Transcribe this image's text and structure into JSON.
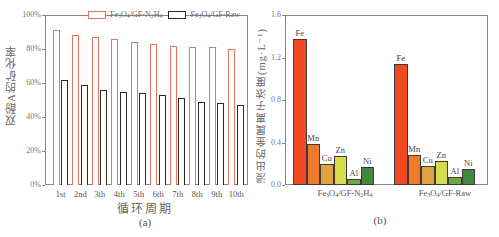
{
  "chart_data": [
    {
      "type": "bar",
      "panel_label": "(a)",
      "title": "",
      "xlabel": "循环周期",
      "ylabel": "双酚A的矿化率",
      "ylim": [
        0,
        100
      ],
      "yticks": [
        "0%",
        "20%",
        "40%",
        "60%",
        "80%",
        "100%"
      ],
      "categories": [
        "1st",
        "2nd",
        "3th",
        "4th",
        "5th",
        "6th",
        "7th",
        "8th",
        "9th",
        "10th"
      ],
      "series": [
        {
          "name": "Fe3O4/GF-N2H4",
          "color": "#e8765a",
          "style": "hollow",
          "values": [
            91,
            88,
            87,
            86,
            84,
            83,
            82,
            81,
            81,
            80
          ]
        },
        {
          "name": "Fe3O4/GF-Raw",
          "color": "#2a2a2a",
          "style": "hollow",
          "values": [
            62,
            59,
            56,
            55,
            54,
            53,
            51,
            49,
            48,
            47
          ]
        }
      ],
      "legend_position": "top-right",
      "grid": false
    },
    {
      "type": "bar",
      "panel_label": "(b)",
      "title": "",
      "xlabel": "",
      "ylabel": "浸出的金属离子浓度(mg·L⁻¹)",
      "ylim": [
        0,
        1.6
      ],
      "yticks": [
        "0.0",
        "0.4",
        "0.8",
        "1.2",
        "1.6"
      ],
      "categories": [
        "Fe3O4/GF-N2H4",
        "Fe3O4/GF-Raw"
      ],
      "series": [
        {
          "name": "Fe",
          "color": "#f04a25",
          "values": [
            1.37,
            1.14
          ]
        },
        {
          "name": "Mn",
          "color": "#ef7a2a",
          "values": [
            0.39,
            0.28
          ]
        },
        {
          "name": "Cu",
          "color": "#e3a140",
          "values": [
            0.2,
            0.18
          ]
        },
        {
          "name": "Zn",
          "color": "#d6dc4a",
          "values": [
            0.27,
            0.23
          ]
        },
        {
          "name": "Al",
          "color": "#6eaa3a",
          "values": [
            0.06,
            0.08
          ]
        },
        {
          "name": "Ni",
          "color": "#3f8a3e",
          "values": [
            0.17,
            0.15
          ]
        }
      ],
      "legend_position": "none (labels above bars)",
      "grid": false
    }
  ],
  "panel_a": {
    "legend": [
      {
        "label_main": "Fe",
        "sub1": "3",
        "mid": "O",
        "sub2": "4",
        "rest": "/GF-N",
        "sub3": "2",
        "tail": "H",
        "sub4": "4"
      },
      {
        "label_main": "Fe",
        "sub1": "3",
        "mid": "O",
        "sub2": "4",
        "rest": "/GF-Raw"
      }
    ],
    "xlabel": "循环周期",
    "ylabel": "双酚A的矿化率",
    "sublabel": "(a)"
  },
  "panel_b": {
    "ylabel": "浸出的金属离子浓度(mg·L⁻¹)",
    "sublabel": "(b)",
    "group1": {
      "a": "Fe",
      "s1": "3",
      "b": "O",
      "s2": "4",
      "c": "/GF-N",
      "s3": "2",
      "d": "H",
      "s4": "4"
    },
    "group2": {
      "a": "Fe",
      "s1": "3",
      "b": "O",
      "s2": "4",
      "c": "/GF-Raw"
    }
  }
}
